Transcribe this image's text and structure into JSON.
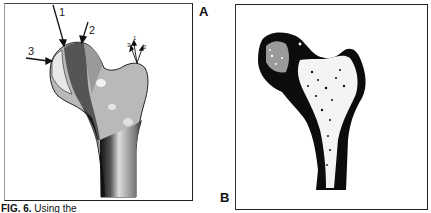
{
  "figure": {
    "panels": [
      {
        "id": "A",
        "label": "A",
        "description": "Shaded finite-element style model of proximal femur with load arrows"
      },
      {
        "id": "B",
        "label": "B",
        "description": "Trabecular bone density image of proximal femur"
      }
    ],
    "arrows_panel_a": [
      {
        "label": "1"
      },
      {
        "label": "2"
      },
      {
        "label": "3"
      }
    ],
    "small_arrows_panel_a": [
      {
        "label": "3"
      },
      {
        "label": "1"
      },
      {
        "label": "2"
      }
    ],
    "caption": {
      "prefix": "FIG. 6.",
      "text": "Using the"
    }
  }
}
